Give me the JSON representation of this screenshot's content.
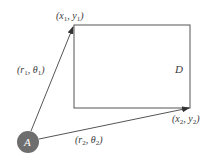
{
  "diagram": {
    "type": "geometry",
    "colors": {
      "line": "#555555",
      "node_fill": "#6e6e6e",
      "node_text": "#ffffff",
      "text": "#3a3a3a",
      "background": "#ffffff"
    },
    "node": {
      "label": "A",
      "cx": 28,
      "cy": 142,
      "r": 11
    },
    "rectangle": {
      "label": "D",
      "x1": 74,
      "y1": 25,
      "x2": 190,
      "y2": 108
    },
    "points": [
      {
        "name": "x1y1",
        "var_x": "x",
        "sub_x": "1",
        "var_y": "y",
        "sub_y": "1"
      },
      {
        "name": "x2y2",
        "var_x": "x",
        "sub_x": "2",
        "var_y": "y",
        "sub_y": "2"
      }
    ],
    "vectors": [
      {
        "name": "r1theta1",
        "r": "r",
        "r_sub": "1",
        "theta": "θ",
        "theta_sub": "1"
      },
      {
        "name": "r2theta2",
        "r": "r",
        "r_sub": "2",
        "theta": "θ",
        "theta_sub": "2"
      }
    ],
    "punct": {
      "open": "(",
      "comma": ", ",
      "close": ")"
    }
  }
}
